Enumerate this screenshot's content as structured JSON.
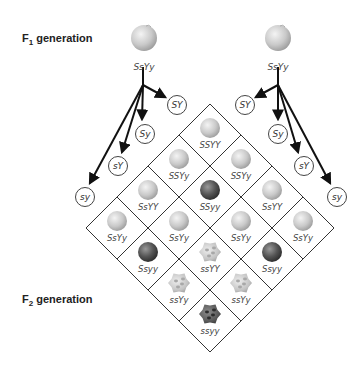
{
  "labels": {
    "f1_prefix": "F",
    "f1_sub": "1",
    "f1_suffix": " generation",
    "f2_prefix": "F",
    "f2_sub": "2",
    "f2_suffix": " generation"
  },
  "parents": [
    {
      "genotype": "SsYy",
      "phenotype": "round-yellow"
    },
    {
      "genotype": "SsYy",
      "phenotype": "round-yellow"
    }
  ],
  "gametes_left": [
    "SY",
    "Sy",
    "sY",
    "sy"
  ],
  "gametes_right": [
    "SY",
    "Sy",
    "sY",
    "sy"
  ],
  "colors": {
    "round_yellow": "#c8c8c8",
    "round_green": "#5a5a5a",
    "wrinkled_yellow": "#d0d0d0",
    "wrinkled_green": "#6a6a6a",
    "grid_line": "#333333"
  },
  "grid": {
    "rows": [
      [
        "SSYY",
        "SSYy",
        "SsYY",
        "SsYy"
      ],
      [
        "SSYy",
        "SSyy",
        "SsYy",
        "Ssyy"
      ],
      [
        "SsYY",
        "SsYy",
        "ssYY",
        "ssYy"
      ],
      [
        "SsYy",
        "Ssyy",
        "ssYy",
        "ssyy"
      ]
    ],
    "phenotypes": [
      [
        "round-yellow",
        "round-yellow",
        "round-yellow",
        "round-yellow"
      ],
      [
        "round-yellow",
        "round-green",
        "round-yellow",
        "round-green"
      ],
      [
        "round-yellow",
        "round-yellow",
        "wrinkled-yellow",
        "wrinkled-yellow"
      ],
      [
        "round-yellow",
        "round-green",
        "wrinkled-yellow",
        "wrinkled-green"
      ]
    ]
  }
}
